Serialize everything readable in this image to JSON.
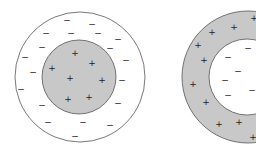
{
  "figure": {
    "colors": {
      "shaded": "#c8c8c8",
      "stroke": "#555555",
      "symbol": "#222222"
    },
    "left": {
      "outer": {
        "cx": 80,
        "cy": 77,
        "r": 65,
        "fill": "#ffffff"
      },
      "inner": {
        "cx": 79,
        "cy": 77,
        "r": 37,
        "fill": "#c8c8c8"
      },
      "plus_symbol": "+",
      "minus_symbol": "−",
      "plus": [
        [
          75,
          53
        ],
        [
          92,
          63
        ],
        [
          52,
          68
        ],
        [
          70,
          78
        ],
        [
          102,
          80
        ],
        [
          68,
          99
        ],
        [
          89,
          97
        ]
      ],
      "minus": [
        [
          67,
          20
        ],
        [
          92,
          24
        ],
        [
          46,
          33
        ],
        [
          71,
          33
        ],
        [
          98,
          33
        ],
        [
          118,
          39
        ],
        [
          42,
          47
        ],
        [
          110,
          48
        ],
        [
          25,
          57
        ],
        [
          126,
          60
        ],
        [
          33,
          72
        ],
        [
          122,
          80
        ],
        [
          21,
          89
        ],
        [
          118,
          103
        ],
        [
          42,
          105
        ],
        [
          48,
          122
        ],
        [
          83,
          122
        ],
        [
          110,
          125
        ],
        [
          75,
          136
        ]
      ]
    },
    "right": {
      "outer": {
        "cx": 248,
        "cy": 77,
        "r": 66,
        "fill": "#c8c8c8"
      },
      "inner": {
        "cx": 247,
        "cy": 77,
        "r": 38,
        "fill": "#ffffff"
      },
      "plus_symbol": "+",
      "minus_symbol": "−",
      "plus": [
        [
          254,
          18
        ],
        [
          234,
          27
        ],
        [
          212,
          32
        ],
        [
          198,
          45
        ],
        [
          204,
          60
        ],
        [
          193,
          84
        ],
        [
          206,
          102
        ],
        [
          219,
          124
        ],
        [
          239,
          122
        ],
        [
          253,
          137
        ]
      ],
      "minus": [
        [
          248,
          48
        ],
        [
          228,
          57
        ],
        [
          238,
          71
        ],
        [
          225,
          80
        ],
        [
          228,
          95
        ],
        [
          252,
          90
        ]
      ]
    }
  }
}
